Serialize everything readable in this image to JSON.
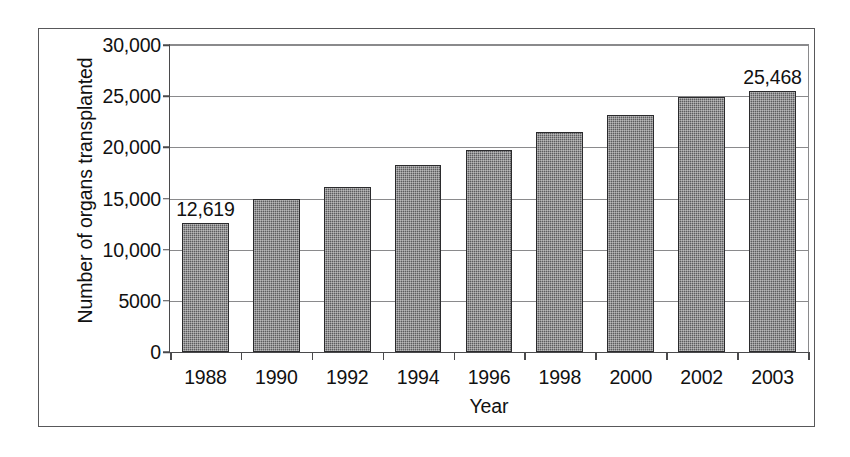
{
  "chart_data": {
    "type": "bar",
    "title": "",
    "xlabel": "Year",
    "ylabel": "Number of organs transplanted",
    "categories": [
      "1988",
      "1990",
      "1992",
      "1994",
      "1996",
      "1998",
      "2000",
      "2002",
      "2003"
    ],
    "values": [
      12619,
      15000,
      16100,
      18300,
      19700,
      21500,
      23200,
      24900,
      25468
    ],
    "point_labels": [
      {
        "category": "1988",
        "text": "12,619"
      },
      {
        "category": "2003",
        "text": "25,468"
      }
    ],
    "ylim": [
      0,
      30000
    ],
    "ytick_values": [
      0,
      5000,
      10000,
      15000,
      20000,
      25000,
      30000
    ],
    "ytick_labels": [
      "0",
      "5000",
      "10,000",
      "15,000",
      "20,000",
      "25,000",
      "30,000"
    ],
    "grid": true,
    "legend": null,
    "series_color": "#5c5c5e",
    "axis_color": "#4a4a4c",
    "grid_color": "#8a8a8c",
    "border_color": "#58585a"
  }
}
